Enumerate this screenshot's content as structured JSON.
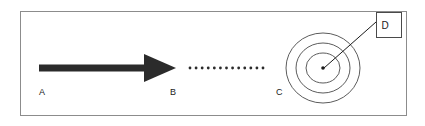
{
  "figure": {
    "background_color": "#ffffff",
    "frame": {
      "name": "outer-frame",
      "x": 20,
      "y": 11,
      "width": 386,
      "height": 104,
      "stroke_color": "#8c8c8c",
      "stroke_width": 1
    },
    "labels": [
      {
        "id": "A",
        "text": "A",
        "x": 39,
        "y": 95,
        "color": "#1a1a1a"
      },
      {
        "id": "B",
        "text": "B",
        "x": 170,
        "y": 95,
        "color": "#1a1a1a"
      },
      {
        "id": "C",
        "text": "C",
        "x": 276,
        "y": 95,
        "color": "#1a1a1a"
      },
      {
        "id": "D",
        "text": "D",
        "x": 385,
        "y": 29,
        "color": "#1a1a1a"
      }
    ],
    "arrow": {
      "name": "solid-arrow",
      "color": "#2b2b2b",
      "shaft_x1": 39,
      "shaft_x2": 146,
      "shaft_y": 68,
      "shaft_thickness": 7,
      "head_tip_x": 176,
      "head_back_x": 144,
      "head_half_height": 14
    },
    "dotted_path": {
      "name": "dotted-path",
      "color": "#2b2b2b",
      "y": 68,
      "x_start": 190,
      "x_end": 263,
      "dot_count": 13,
      "dot_radius": 1.4
    },
    "target": {
      "name": "concentric-target",
      "center_x": 323,
      "center_y": 68,
      "stroke_color": "#4a4a4a",
      "stroke_width": 0.9,
      "rings": [
        {
          "rx": 37,
          "ry": 35
        },
        {
          "rx": 27,
          "ry": 25
        },
        {
          "rx": 17,
          "ry": 15
        }
      ],
      "center_dot": {
        "cx": 323,
        "cy": 68,
        "r": 1.8,
        "color": "#1a1a1a"
      }
    },
    "callout": {
      "name": "callout-d",
      "box": {
        "x": 376,
        "y": 12,
        "width": 25,
        "height": 25,
        "stroke_color": "#4a4a4a",
        "stroke_width": 1,
        "fill": "#ffffff"
      },
      "leader_line": {
        "x1": 376,
        "y1": 22,
        "x2": 324,
        "y2": 68,
        "stroke_color": "#1a1a1a",
        "stroke_width": 1
      }
    }
  }
}
